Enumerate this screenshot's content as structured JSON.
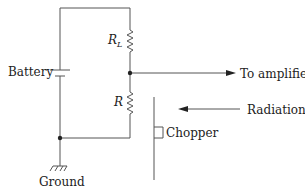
{
  "diagram": {
    "labels": {
      "battery": "Battery",
      "load_resistor": "R",
      "load_resistor_sub": "L",
      "detector_resistor": "R",
      "output": "To amplifier",
      "radiation": "Radiation",
      "chopper": "Chopper",
      "ground": "Ground"
    },
    "colors": {
      "line": "#555555",
      "text": "#222222",
      "background": "#ffffff"
    }
  }
}
